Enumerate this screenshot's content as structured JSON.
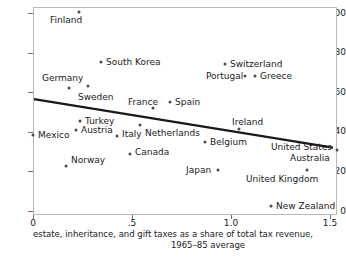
{
  "chart_data": {
    "type": "scatter",
    "title": "",
    "xlabel": "estate, inheritance, and gift taxes as a share of total tax revenue, 1965–85 average",
    "ylabel": "",
    "xlim": [
      0,
      1.5
    ],
    "ylim": [
      0,
      100
    ],
    "xticks": [
      0,
      0.5,
      1.0,
      1.5
    ],
    "xtick_labels": [
      "0",
      ".5",
      "1.0",
      "1.5"
    ],
    "yticks": [
      0,
      20,
      40,
      60,
      80,
      100
    ],
    "ytick_labels": [
      "0",
      "20",
      "40",
      "60",
      "80",
      "100"
    ],
    "grid": false,
    "legend": "none",
    "point_color": "#4a4a4a",
    "line_color": "#1a1a1a",
    "trendline": {
      "x0": 0.0,
      "y0": 57.0,
      "x1": 1.51,
      "y1": 32.5
    },
    "points": [
      {
        "label": "Finland",
        "x": 0.232,
        "y": 100.5,
        "lx": 50,
        "ly": 16
      },
      {
        "label": "South Korea",
        "x": 0.344,
        "y": 75.3,
        "lx": 106,
        "ly": 58
      },
      {
        "label": "Switzerland",
        "x": 0.97,
        "y": 74.2,
        "lx": 230,
        "ly": 60
      },
      {
        "label": "Germany",
        "x": 0.182,
        "y": 62.1,
        "lx": 42,
        "ly": 74
      },
      {
        "label": "Portugal",
        "x": 1.071,
        "y": 68.2,
        "lx": 206,
        "ly": 72
      },
      {
        "label": "Greece",
        "x": 1.121,
        "y": 68.2,
        "lx": 260,
        "ly": 72
      },
      {
        "label": "Sweden",
        "x": 0.278,
        "y": 63.1,
        "lx": 78,
        "ly": 93
      },
      {
        "label": "France",
        "x": 0.606,
        "y": 52.0,
        "lx": 128,
        "ly": 98
      },
      {
        "label": "Spain",
        "x": 0.692,
        "y": 55.1,
        "lx": 175,
        "ly": 98
      },
      {
        "label": "Turkey",
        "x": 0.237,
        "y": 45.5,
        "lx": 85,
        "ly": 117
      },
      {
        "label": "Ireland",
        "x": 1.04,
        "y": 41.4,
        "lx": 232,
        "ly": 118
      },
      {
        "label": "Austria",
        "x": 0.217,
        "y": 40.9,
        "lx": 81,
        "ly": 126
      },
      {
        "label": "Netherlands",
        "x": 0.54,
        "y": 43.4,
        "lx": 145,
        "ly": 129
      },
      {
        "label": "Mexico",
        "x": 0.0,
        "y": 38.4,
        "lx": 38,
        "ly": 131
      },
      {
        "label": "Italy",
        "x": 0.424,
        "y": 37.9,
        "lx": 122,
        "ly": 130
      },
      {
        "label": "Belgium",
        "x": 0.869,
        "y": 34.8,
        "lx": 210,
        "ly": 138
      },
      {
        "label": "United States",
        "x": 1.5,
        "y": 32.3,
        "lx": 271,
        "ly": 143
      },
      {
        "label": "Canada",
        "x": 0.49,
        "y": 28.8,
        "lx": 135,
        "ly": 148
      },
      {
        "label": "Australia",
        "x": 1.535,
        "y": 30.8,
        "lx": 290,
        "ly": 154
      },
      {
        "label": "Norway",
        "x": 0.167,
        "y": 22.7,
        "lx": 71,
        "ly": 156
      },
      {
        "label": "Japan",
        "x": 0.934,
        "y": 20.7,
        "lx": 186,
        "ly": 166
      },
      {
        "label": "United Kingdom",
        "x": 1.384,
        "y": 20.7,
        "lx": 246,
        "ly": 175
      },
      {
        "label": "New Zealand",
        "x": 1.202,
        "y": 2.5,
        "lx": 276,
        "ly": 202
      }
    ]
  },
  "caption": {
    "line1": "estate, inheritance, and gift taxes as a share of total tax revenue,",
    "line2": "1965–85 average"
  }
}
